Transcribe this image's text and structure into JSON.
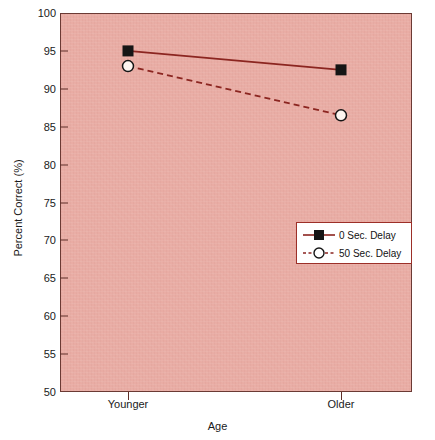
{
  "chart_data": {
    "type": "line",
    "title": "",
    "xlabel": "Age",
    "ylabel": "Percent Correct (%)",
    "categories": [
      "Younger",
      "Older"
    ],
    "x": [
      0,
      1
    ],
    "ylim": [
      50,
      100
    ],
    "yticks": [
      50,
      55,
      60,
      65,
      70,
      75,
      80,
      85,
      90,
      95,
      100
    ],
    "ytick_labels": [
      "50",
      "55",
      "60",
      "65",
      "70",
      "75",
      "80",
      "85",
      "90",
      "95",
      "100"
    ],
    "grid": false,
    "legend_position": "center-right",
    "series": [
      {
        "name": "0 Sec. Delay",
        "values": [
          95.0,
          92.5
        ],
        "marker": "filled-square",
        "linestyle": "solid",
        "color": "#8b2520"
      },
      {
        "name": "50 Sec. Delay",
        "values": [
          93.0,
          86.5
        ],
        "marker": "open-circle",
        "linestyle": "dashed",
        "color": "#8b2520"
      }
    ]
  },
  "axes": {
    "y_title": "Percent Correct (%)",
    "x_title": "Age",
    "y_tick_labels": [
      "100",
      "95",
      "90",
      "85",
      "80",
      "75",
      "70",
      "65",
      "60",
      "55",
      "50"
    ],
    "x_tick_labels": [
      "Younger",
      "Older"
    ]
  },
  "legend": {
    "entries": [
      {
        "label": "0 Sec. Delay"
      },
      {
        "label": "50 Sec. Delay"
      }
    ]
  },
  "colors": {
    "plot_background": "#e9aca4",
    "line": "#8b2520",
    "frame": "#6b3a34",
    "legend_border": "#9c2f28",
    "text": "#1a1a1a",
    "page_background": "#ffffff"
  }
}
